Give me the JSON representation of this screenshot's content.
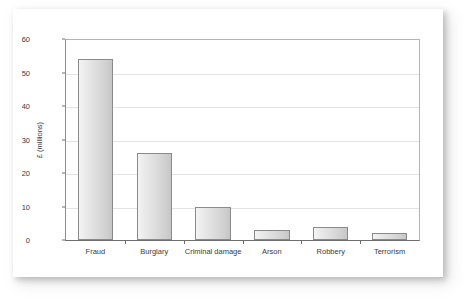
{
  "chart_data": {
    "type": "bar",
    "title": "",
    "xlabel": "",
    "ylabel": "£ (millions)",
    "categories": [
      "Fraud",
      "Burglary",
      "Criminal damage",
      "Arson",
      "Robbery",
      "Terrorism"
    ],
    "values": [
      54,
      26,
      10,
      3,
      4,
      2
    ],
    "ylim": [
      0,
      60
    ],
    "ytick_step": 10,
    "yticks": [
      0,
      10,
      20,
      30,
      40,
      50,
      60
    ],
    "ytick_labels": [
      "0",
      "10",
      "20",
      "30",
      "40",
      "50",
      "60"
    ],
    "grid": true,
    "grid_axis": "y",
    "legend": false,
    "legend_position": "none",
    "series": [
      {
        "name": "Cost",
        "values": [
          54,
          26,
          10,
          3,
          4,
          2
        ]
      }
    ],
    "bar_fill_color": "#dcdcdc",
    "bar_edge_color": "#8a8a8a",
    "grid_color": "#e3e3e3",
    "axis_color": "#6e6e6e",
    "background_color": "#ffffff",
    "text_color": "#3a3a3a"
  }
}
